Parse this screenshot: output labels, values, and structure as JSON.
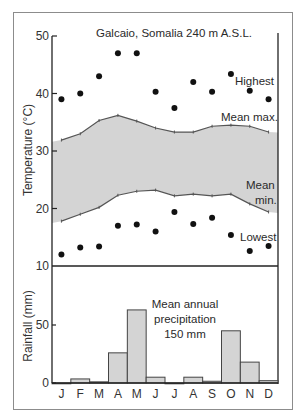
{
  "chart_data": [
    {
      "type": "line",
      "title": "Galcaio, Somalia 240 m A.S.L.",
      "xlabel": "",
      "ylabel": "Temperature (°C)",
      "categories": [
        "J",
        "F",
        "M",
        "A",
        "M",
        "J",
        "J",
        "A",
        "S",
        "O",
        "N",
        "D"
      ],
      "ylim": [
        10,
        50
      ],
      "yticks": [
        10,
        20,
        30,
        40,
        50
      ],
      "grid": false,
      "series": [
        {
          "name": "Highest",
          "style": "scatter",
          "values": [
            39,
            40,
            43,
            47,
            47,
            40.3,
            37.5,
            42,
            40.3,
            43.4,
            40.5,
            39
          ]
        },
        {
          "name": "Mean max.",
          "style": "line",
          "values": [
            31.9,
            33,
            35.3,
            36.2,
            35.2,
            34,
            33.3,
            33.3,
            34.3,
            34.5,
            34.3,
            33.3
          ]
        },
        {
          "name": "Mean min.",
          "style": "line",
          "values": [
            17.8,
            19,
            20.2,
            22.3,
            23,
            23.2,
            22.2,
            22.5,
            22.2,
            22.5,
            20.8,
            19.4
          ]
        },
        {
          "name": "Lowest",
          "style": "scatter",
          "values": [
            12,
            13.2,
            13.4,
            17,
            17.2,
            16,
            19.4,
            17.3,
            18.4,
            15.4,
            12.6,
            13.5
          ]
        }
      ],
      "band": {
        "between": [
          "Mean max.",
          "Mean min."
        ],
        "color": "#d4d4d4"
      },
      "annotations": {
        "highest": "Highest",
        "mean_max": "Mean max.",
        "mean_min_1": "Mean",
        "mean_min_2": "min.",
        "lowest": "Lowest"
      }
    },
    {
      "type": "bar",
      "title": "",
      "xlabel": "",
      "ylabel": "Rainfall (mm)",
      "categories": [
        "J",
        "F",
        "M",
        "A",
        "M",
        "J",
        "J",
        "A",
        "S",
        "O",
        "N",
        "D"
      ],
      "values": [
        0,
        3.5,
        1,
        26,
        63,
        5,
        0,
        5,
        1.5,
        45,
        18,
        2
      ],
      "ylim": [
        0,
        50
      ],
      "yticks": [
        0,
        50
      ],
      "bar_color": "#d4d4d4",
      "annotation_lines": [
        "Mean annual",
        "precipitation",
        "150 mm"
      ]
    }
  ],
  "labels": {
    "temp_ylabel": "Temperature (°C)",
    "rain_ylabel": "Rainfall (mm)",
    "title": "Galcaio, Somalia 240 m A.S.L."
  }
}
